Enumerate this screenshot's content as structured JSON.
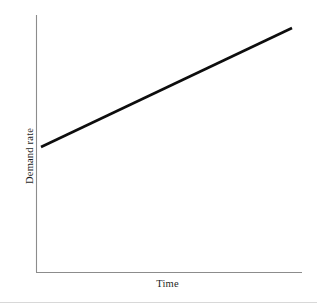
{
  "figure": {
    "background_color": "#ffffff",
    "width": 317,
    "height": 306
  },
  "chart_data": {
    "type": "line",
    "title": "",
    "subtitle": "",
    "xlabel": "Time",
    "ylabel": "Demand rate",
    "grid": false,
    "legend": false,
    "legend_position": "none",
    "axis_style": {
      "spines": [
        "left",
        "bottom"
      ],
      "color": "#8c8c8c",
      "ticks": "none",
      "tick_labels": "none"
    },
    "xlim": [
      0,
      1
    ],
    "ylim": [
      0,
      1
    ],
    "x": [
      0.02,
      1.0
    ],
    "y": [
      0.486,
      0.949
    ],
    "series": [
      {
        "name": "Demand rate",
        "color": "#0d0d0d",
        "line_width": 2.6,
        "style": "solid",
        "x": [
          0.02,
          1.0
        ],
        "values": [
          0.486,
          0.949
        ],
        "description": "Linear increasing trend"
      }
    ],
    "annotations": []
  },
  "labels": {
    "x_axis_title": "Time",
    "y_axis_title": "Demand rate"
  },
  "colors": {
    "series": "#0d0d0d",
    "axis": "#8c8c8c",
    "background": "#ffffff",
    "footer_rule": "#d8d8d8"
  }
}
